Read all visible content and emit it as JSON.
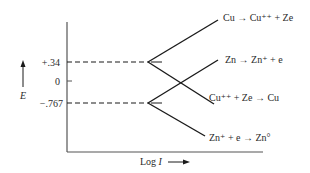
{
  "diagram": {
    "type": "evans-diagram",
    "y_axis": {
      "label": "E",
      "ticks": [
        {
          "label": "+.34",
          "value": 0.34
        },
        {
          "label": "0",
          "value": 0
        },
        {
          "label": "−.767",
          "value": -0.767
        }
      ]
    },
    "x_axis": {
      "label": "Log I"
    },
    "reactions": [
      {
        "label": "Cu → Cu⁺⁺ + Ze",
        "branch": "anodic",
        "origin": "+.34"
      },
      {
        "label": "Zn → Zn⁺ + e",
        "branch": "anodic",
        "origin": "−.767"
      },
      {
        "label": "Cu⁺⁺ + Ze → Cu",
        "branch": "cathodic",
        "origin": "+.34"
      },
      {
        "label": "Zn⁺ + e → Zn°",
        "branch": "cathodic",
        "origin": "−.767"
      }
    ],
    "colors": {
      "line": "#1a1a1a",
      "axis": "#555555",
      "text": "#2a2a2a"
    }
  }
}
